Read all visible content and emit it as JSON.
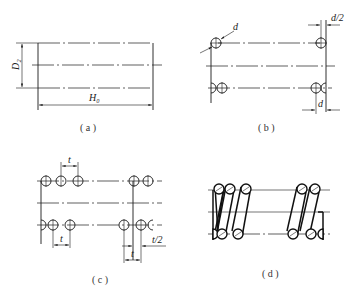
{
  "figure": {
    "panels": [
      {
        "id": "a",
        "caption": "( a )",
        "labels": {
          "diameter": "D₂",
          "height": "H₀"
        }
      },
      {
        "id": "b",
        "caption": "( b )",
        "labels": {
          "wire_diameter": "d",
          "half_diameter": "d/2",
          "bottom_diameter": "d"
        }
      },
      {
        "id": "c",
        "caption": "( c )",
        "labels": {
          "pitch_top": "t",
          "pitch_bottom": "t",
          "half_pitch": "t/2",
          "pitch_right": "t"
        }
      },
      {
        "id": "d",
        "caption": "( d )",
        "labels": {}
      }
    ]
  }
}
